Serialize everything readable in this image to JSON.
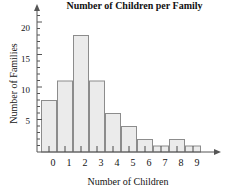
{
  "chart_data": {
    "type": "bar",
    "title": "Number of Children per Family",
    "xlabel": "Number of Children",
    "ylabel": "Number of Families",
    "categories": [
      "0",
      "1",
      "2",
      "3",
      "4",
      "5",
      "6",
      "7",
      "8",
      "9"
    ],
    "values": [
      8,
      11,
      18,
      11,
      6,
      4,
      2,
      1,
      2,
      1
    ],
    "ylim": [
      0,
      21
    ],
    "xlim": [
      -0.5,
      9.5
    ],
    "y_major_ticks": [
      5,
      10,
      15,
      20
    ],
    "y_minor_tick_interval": 1,
    "grid": false,
    "legend": false,
    "bar_fill_color": "#ebebeb",
    "bar_border_color": "#8c8c8c",
    "axis_color": "#555555",
    "axis_arrows": [
      "y-top",
      "x-right"
    ]
  },
  "axes": {
    "y_tick_labels": [
      "20",
      "15",
      "10",
      "5"
    ],
    "x_tick_labels": [
      "0",
      "1",
      "2",
      "3",
      "4",
      "5",
      "6",
      "7",
      "8",
      "9"
    ]
  }
}
